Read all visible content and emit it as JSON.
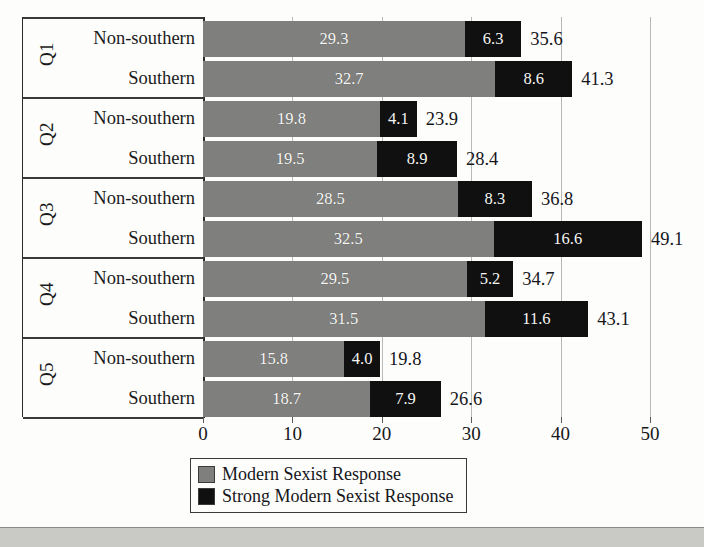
{
  "chart_data": {
    "type": "bar",
    "orientation": "horizontal",
    "stacked": true,
    "title": "",
    "subtitle": "",
    "xlabel": "",
    "ylabel": "",
    "xlim": [
      0,
      50
    ],
    "xticks": [
      0,
      10,
      20,
      30,
      40,
      50
    ],
    "xtick_labels": [
      "0",
      "10",
      "20",
      "30",
      "40",
      "50"
    ],
    "grid": "vertical",
    "legend_position": "bottom-center",
    "series": [
      {
        "name": "Modern Sexist Response",
        "color": "#7f7f7d",
        "values": [
          29.3,
          32.7,
          19.8,
          19.5,
          28.5,
          32.5,
          29.5,
          31.5,
          15.8,
          18.7
        ]
      },
      {
        "name": "Strong Modern Sexist Response",
        "color": "#101010",
        "values": [
          6.3,
          8.6,
          4.1,
          8.9,
          8.3,
          16.6,
          5.2,
          11.6,
          4.0,
          7.9
        ]
      }
    ],
    "totals": [
      35.6,
      41.3,
      23.9,
      28.4,
      36.8,
      49.1,
      34.7,
      43.1,
      19.8,
      26.6
    ],
    "categories": [
      "Q1 Non-southern",
      "Q1 Southern",
      "Q2 Non-southern",
      "Q2 Southern",
      "Q3 Non-southern",
      "Q3 Southern",
      "Q4 Non-southern",
      "Q4 Southern",
      "Q5 Non-southern",
      "Q5 Southern"
    ]
  },
  "groups": [
    {
      "group_label": "Q1",
      "rows": [
        {
          "row_label": "Non-southern",
          "modern": "29.3",
          "strong": "6.3",
          "total": "35.6"
        },
        {
          "row_label": "Southern",
          "modern": "32.7",
          "strong": "8.6",
          "total": "41.3"
        }
      ]
    },
    {
      "group_label": "Q2",
      "rows": [
        {
          "row_label": "Non-southern",
          "modern": "19.8",
          "strong": "4.1",
          "total": "23.9"
        },
        {
          "row_label": "Southern",
          "modern": "19.5",
          "strong": "8.9",
          "total": "28.4"
        }
      ]
    },
    {
      "group_label": "Q3",
      "rows": [
        {
          "row_label": "Non-southern",
          "modern": "28.5",
          "strong": "8.3",
          "total": "36.8"
        },
        {
          "row_label": "Southern",
          "modern": "32.5",
          "strong": "16.6",
          "total": "49.1"
        }
      ]
    },
    {
      "group_label": "Q4",
      "rows": [
        {
          "row_label": "Non-southern",
          "modern": "29.5",
          "strong": "5.2",
          "total": "34.7"
        },
        {
          "row_label": "Southern",
          "modern": "31.5",
          "strong": "11.6",
          "total": "43.1"
        }
      ]
    },
    {
      "group_label": "Q5",
      "rows": [
        {
          "row_label": "Non-southern",
          "modern": "15.8",
          "strong": "4.0",
          "total": "19.8"
        },
        {
          "row_label": "Southern",
          "modern": "18.7",
          "strong": "7.9",
          "total": "26.6"
        }
      ]
    }
  ],
  "axis": {
    "ticks": [
      "0",
      "10",
      "20",
      "30",
      "40",
      "50"
    ]
  },
  "legend": {
    "items": [
      {
        "label": "Modern Sexist Response",
        "swatch": "modern",
        "color": "#7f7f7d"
      },
      {
        "label": "Strong Modern Sexist Response",
        "swatch": "strong",
        "color": "#101010"
      }
    ]
  }
}
